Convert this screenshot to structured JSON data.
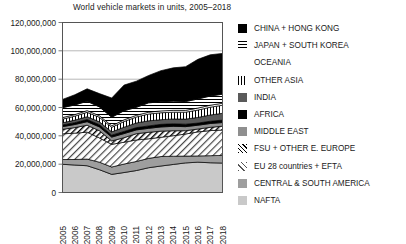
{
  "chart_data": {
    "type": "area",
    "title": "World vehicle markets in units, 2005–2018",
    "xlabel": "",
    "ylabel": "",
    "stacked": true,
    "grid": true,
    "legend_position": "right",
    "ylim": [
      0,
      120000000
    ],
    "yticks": [
      0,
      20000000,
      40000000,
      60000000,
      80000000,
      100000000,
      120000000
    ],
    "ytick_labels": [
      "0",
      "20,000,000",
      "40,000,000",
      "60,000,000",
      "80,000,000",
      "100,000,000",
      "120,000,000"
    ],
    "categories": [
      2005,
      2006,
      2007,
      2008,
      2009,
      2010,
      2011,
      2012,
      2013,
      2014,
      2015,
      2016,
      2017,
      2018
    ],
    "x": [
      "2005",
      "2006",
      "2007",
      "2008",
      "2009",
      "2010",
      "2011",
      "2012",
      "2013",
      "2014",
      "2015",
      "2016",
      "2017",
      "2018"
    ],
    "series": [
      {
        "name": "NAFTA",
        "fill": "light-gray-solid",
        "color": "#c9c9c9",
        "values": [
          19900000,
          19400000,
          18900000,
          16100000,
          12800000,
          14100000,
          15500000,
          17500000,
          18700000,
          19800000,
          20900000,
          21400000,
          21000000,
          20800000
        ]
      },
      {
        "name": "CENTRAL & SOUTH AMERICA",
        "fill": "medium-gray-solid",
        "color": "#9e9e9e",
        "values": [
          3400000,
          3900000,
          4700000,
          5300000,
          5200000,
          6000000,
          6400000,
          6600000,
          6700000,
          5800000,
          4800000,
          4400000,
          5000000,
          5400000
        ]
      },
      {
        "name": "EU 28 countries + EFTA",
        "fill": "light-diagonal-hatch",
        "color": "#ffffff",
        "values": [
          18100000,
          18600000,
          19000000,
          17100000,
          16000000,
          15400000,
          15200000,
          13800000,
          13600000,
          14500000,
          15600000,
          17000000,
          17700000,
          17900000
        ]
      },
      {
        "name": "FSU + OTHER E. EUROPE",
        "fill": "diagonal-hatch",
        "color": "#ffffff",
        "values": [
          3200000,
          3900000,
          4900000,
          5100000,
          2400000,
          3200000,
          4400000,
          4600000,
          4300000,
          3500000,
          2300000,
          2000000,
          2300000,
          2700000
        ]
      },
      {
        "name": "MIDDLE EAST",
        "fill": "gray-solid",
        "color": "#8f8f8f",
        "values": [
          1900000,
          2200000,
          2500000,
          2700000,
          2700000,
          2900000,
          2700000,
          2800000,
          3000000,
          3100000,
          2900000,
          2700000,
          2700000,
          2600000
        ]
      },
      {
        "name": "AFRICA",
        "fill": "black-solid",
        "color": "#000000",
        "values": [
          1200000,
          1300000,
          1500000,
          1600000,
          1400000,
          1500000,
          1600000,
          1700000,
          1800000,
          1800000,
          1700000,
          1500000,
          1600000,
          1700000
        ]
      },
      {
        "name": "INDIA",
        "fill": "dark-gray-solid",
        "color": "#5a5a5a",
        "values": [
          1500000,
          1800000,
          2000000,
          2000000,
          2300000,
          3000000,
          3300000,
          3600000,
          3300000,
          3400000,
          3600000,
          4000000,
          4400000,
          4800000
        ]
      },
      {
        "name": "OTHER ASIA",
        "fill": "vertical-lines",
        "color": "#ffffff",
        "values": [
          2600000,
          2800000,
          3100000,
          3200000,
          3200000,
          4000000,
          4200000,
          4800000,
          4900000,
          4800000,
          4900000,
          5200000,
          5500000,
          5700000
        ]
      },
      {
        "name": "OCEANIA",
        "fill": "white-blank",
        "color": "#ffffff",
        "values": [
          1100000,
          1100000,
          1200000,
          1100000,
          1100000,
          1200000,
          1200000,
          1300000,
          1300000,
          1300000,
          1300000,
          1400000,
          1400000,
          1400000
        ]
      },
      {
        "name": "JAPAN + SOUTH KOREA",
        "fill": "horizontal-lines",
        "color": "#ffffff",
        "values": [
          7000000,
          6800000,
          6600000,
          6200000,
          6000000,
          6400000,
          5600000,
          6600000,
          6400000,
          6500000,
          6200000,
          6400000,
          6500000,
          6400000
        ]
      },
      {
        "name": "CHINA + HONG KONG",
        "fill": "black-solid",
        "color": "#000000",
        "values": [
          5800000,
          7200000,
          8800000,
          9400000,
          13600000,
          18100000,
          18500000,
          19300000,
          22000000,
          23500000,
          24600000,
          28000000,
          29100000,
          28800000
        ]
      }
    ]
  },
  "legend": {
    "items": [
      {
        "label": "CHINA + HONG KONG",
        "swatch": "solid-black"
      },
      {
        "label": "JAPAN + SOUTH KOREA",
        "swatch": "horizontal-lines"
      },
      {
        "label": "OCEANIA",
        "swatch": "blank"
      },
      {
        "label": "OTHER ASIA",
        "swatch": "vertical-lines"
      },
      {
        "label": "INDIA",
        "swatch": "dark-gray"
      },
      {
        "label": "AFRICA",
        "swatch": "solid-black"
      },
      {
        "label": "MIDDLE EAST",
        "swatch": "mid-gray"
      },
      {
        "label": "FSU + OTHER E. EUROPE",
        "swatch": "diagonal-hatch"
      },
      {
        "label": "EU 28 countries + EFTA",
        "swatch": "light-diagonal-hatch"
      },
      {
        "label": "CENTRAL & SOUTH AMERICA",
        "swatch": "gray"
      },
      {
        "label": "NAFTA",
        "swatch": "light-gray"
      }
    ]
  }
}
